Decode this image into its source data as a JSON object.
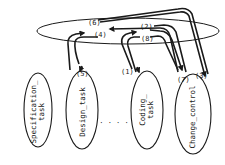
{
  "diagram": {
    "type": "process-interaction-diagram",
    "shared_space": {
      "label": ""
    },
    "tasks": [
      {
        "id": "spec",
        "line1": "Specification_",
        "line2": "task"
      },
      {
        "id": "design",
        "line1": "Design_task",
        "line2": ""
      },
      {
        "id": "coding",
        "line1": "Coding_",
        "line2": "task"
      },
      {
        "id": "change",
        "line1": "Change_control",
        "line2": ""
      }
    ],
    "ellipsis": "· · · ·",
    "arrow_labels": {
      "a1": "(1)",
      "a2": "(2)",
      "a3": "(3)",
      "a4": "(4)",
      "a5": "(5)",
      "a6": "(6)",
      "a7": "(7)",
      "a8": "(8)"
    },
    "colors": {
      "stroke": "#1a1a1a",
      "background": "#ffffff"
    }
  }
}
